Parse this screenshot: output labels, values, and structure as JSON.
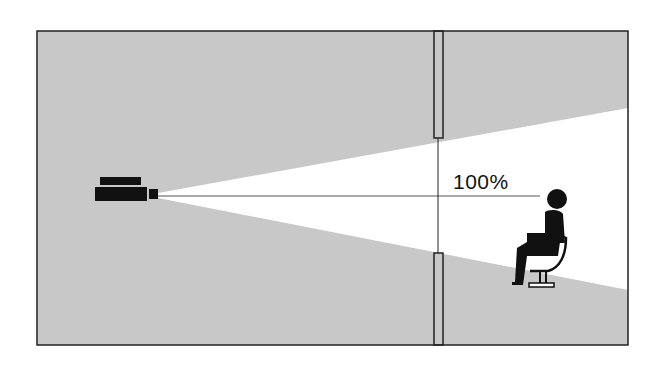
{
  "diagram": {
    "type": "projection-illustration",
    "colors": {
      "background": "#c8c8c8",
      "beam": "#ffffff",
      "ink": "#111111",
      "frame": "#222222"
    },
    "labels": {
      "brightness": "100%"
    },
    "elements": [
      {
        "name": "projector",
        "description": "black projector on left emitting light"
      },
      {
        "name": "light-beam",
        "description": "white cone widening to the right"
      },
      {
        "name": "center-line",
        "description": "thin horizontal axis line from projector to viewer"
      },
      {
        "name": "window-frame",
        "description": "vertical window/wall divider with upper and lower panes"
      },
      {
        "name": "seated-viewer",
        "description": "person silhouette seated on chair in beam"
      }
    ]
  }
}
